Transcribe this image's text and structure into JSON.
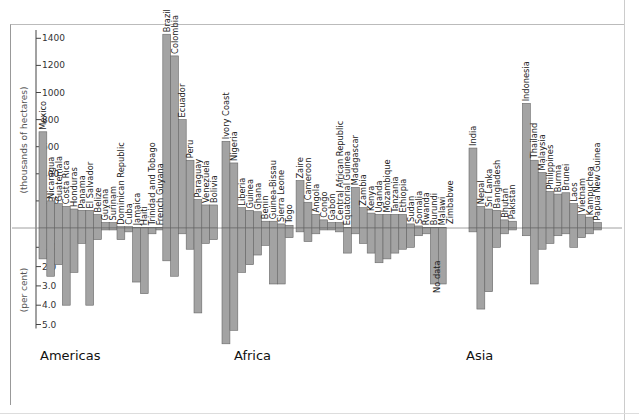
{
  "chart_data": {
    "type": "bar",
    "title": "",
    "upper_axis": {
      "label": "(thousands of hectares)",
      "ticks": [
        200,
        400,
        600,
        800,
        1000,
        1200,
        1400
      ],
      "range": [
        0,
        1450
      ]
    },
    "lower_axis": {
      "label": "(per cent)",
      "ticks": [
        "1.0",
        "2.0",
        "3.0",
        "4.0",
        "5.0"
      ],
      "range": [
        0,
        5.0
      ]
    },
    "regions": [
      {
        "name": "Americas",
        "countries": [
          {
            "name": "Mexico",
            "area": 710,
            "rate": 1.6
          },
          {
            "name": "Nicaragua",
            "area": 200,
            "rate": 2.5
          },
          {
            "name": "Guatemala",
            "area": 180,
            "rate": 1.9
          },
          {
            "name": "Costa Rica",
            "area": 160,
            "rate": 4.0
          },
          {
            "name": "Honduras",
            "area": 140,
            "rate": 2.3
          },
          {
            "name": "Panama",
            "area": 130,
            "rate": 0.8
          },
          {
            "name": "El Salvador",
            "area": 130,
            "rate": 4.0
          },
          {
            "name": "Belize",
            "area": 100,
            "rate": 0.6
          },
          {
            "name": "Guyana",
            "area": 40,
            "rate": 0.1
          },
          {
            "name": "Surinam",
            "area": 40,
            "rate": 0.1
          },
          {
            "name": "Dominican Republic",
            "area": 10,
            "rate": 0.6
          },
          {
            "name": "Cuba",
            "area": 10,
            "rate": 0.2
          },
          {
            "name": "Jamaica",
            "area": 5,
            "rate": 2.8
          },
          {
            "name": "Haiti",
            "area": 5,
            "rate": 3.4
          },
          {
            "name": "Trinidad and Tobago",
            "area": 5,
            "rate": 0.3
          },
          {
            "name": "French Guyana",
            "area": 5,
            "rate": 0.1
          },
          {
            "name": "Brazil",
            "area": 1430,
            "rate": 1.7
          },
          {
            "name": "Colombia",
            "area": 1270,
            "rate": 2.5
          },
          {
            "name": "Ecuador",
            "area": 800,
            "rate": 0.3
          },
          {
            "name": "Peru",
            "area": 500,
            "rate": 1.1
          },
          {
            "name": "Paraguay",
            "area": 210,
            "rate": 4.4
          },
          {
            "name": "Venezuela",
            "area": 170,
            "rate": 0.8
          },
          {
            "name": "Bolivia",
            "area": 170,
            "rate": 0.6
          }
        ]
      },
      {
        "name": "Africa",
        "countries": [
          {
            "name": "Ivory Coast",
            "area": 640,
            "rate": 6.0
          },
          {
            "name": "Nigeria",
            "area": 480,
            "rate": 5.3
          },
          {
            "name": "Liberia",
            "area": 150,
            "rate": 2.3
          },
          {
            "name": "Guinea",
            "area": 130,
            "rate": 1.9
          },
          {
            "name": "Ghana",
            "area": 120,
            "rate": 1.4
          },
          {
            "name": "Benin",
            "area": 50,
            "rate": 0.9
          },
          {
            "name": "Guinea-Bissau",
            "area": 50,
            "rate": 2.9
          },
          {
            "name": "Sierra Leone",
            "area": 30,
            "rate": 2.9
          },
          {
            "name": "Togo",
            "area": 20,
            "rate": 0.5
          },
          {
            "name": "Zaire",
            "area": 350,
            "rate": 0.2
          },
          {
            "name": "Cameroon",
            "area": 190,
            "rate": 0.7
          },
          {
            "name": "Angola",
            "area": 100,
            "rate": 0.3
          },
          {
            "name": "Congo",
            "area": 60,
            "rate": 0.1
          },
          {
            "name": "Gabon",
            "area": 40,
            "rate": 0.1
          },
          {
            "name": "Central African Republic",
            "area": 40,
            "rate": 0.2
          },
          {
            "name": "Equatorial Guinea",
            "area": 5,
            "rate": 1.3
          },
          {
            "name": "Madagascar",
            "area": 300,
            "rate": 0.3
          },
          {
            "name": "Zambia",
            "area": 150,
            "rate": 0.8
          },
          {
            "name": "Kenya",
            "area": 110,
            "rate": 1.3
          },
          {
            "name": "Uganda",
            "area": 100,
            "rate": 1.8
          },
          {
            "name": "Mozambique",
            "area": 100,
            "rate": 1.6
          },
          {
            "name": "Tanzania",
            "area": 100,
            "rate": 1.3
          },
          {
            "name": "Ethiopia",
            "area": 100,
            "rate": 1.1
          },
          {
            "name": "Sudan",
            "area": 30,
            "rate": 1.0
          },
          {
            "name": "Somalia",
            "area": 15,
            "rate": 0.4
          },
          {
            "name": "Rwanda",
            "area": 5,
            "rate": 0.3
          },
          {
            "name": "Burundi",
            "area": 5,
            "rate": 2.9
          },
          {
            "name": "Malawi",
            "area": 5,
            "rate": 2.9
          },
          {
            "name": "Zimbabwe",
            "area": null,
            "rate": null,
            "note": "No data"
          }
        ]
      },
      {
        "name": "Asia",
        "countries": [
          {
            "name": "India",
            "area": 590,
            "rate": 0.2
          },
          {
            "name": "Nepal",
            "area": 160,
            "rate": 4.2
          },
          {
            "name": "Sri Lanka",
            "area": 140,
            "rate": 3.3
          },
          {
            "name": "Bangladesh",
            "area": 130,
            "rate": 1.0
          },
          {
            "name": "Bhutan",
            "area": 60,
            "rate": 0.3
          },
          {
            "name": "Pakistan",
            "area": 50,
            "rate": 0.1
          },
          {
            "name": "Indonesia",
            "area": 920,
            "rate": 0.4
          },
          {
            "name": "Thailand",
            "area": 500,
            "rate": 2.9
          },
          {
            "name": "Malaysia",
            "area": 410,
            "rate": 1.1
          },
          {
            "name": "Philippines",
            "area": 270,
            "rate": 0.8
          },
          {
            "name": "Burma",
            "area": 250,
            "rate": 0.4
          },
          {
            "name": "Brunei",
            "area": 260,
            "rate": 0.3
          },
          {
            "name": "Laos",
            "area": 180,
            "rate": 1.0
          },
          {
            "name": "Vietnam",
            "area": 100,
            "rate": 0.5
          },
          {
            "name": "Kampuchea",
            "area": 80,
            "rate": 0.3
          },
          {
            "name": "Papua New Guinea",
            "area": 40,
            "rate": 0.1
          }
        ]
      }
    ],
    "no_data_label": "No data",
    "grid": false,
    "legend": null
  }
}
